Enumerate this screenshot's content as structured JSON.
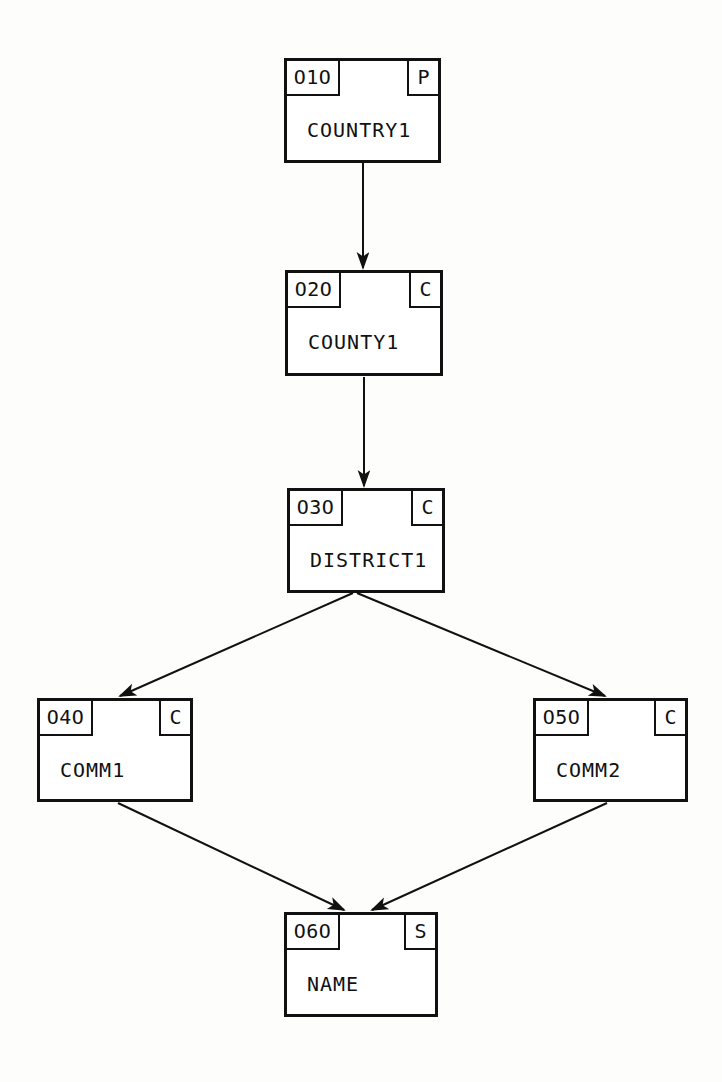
{
  "diagram": {
    "background_color": "#fdfdfb",
    "line_color": "#111111",
    "nodes": [
      {
        "id": "O1O",
        "label": "COUNTRY1",
        "flag": "P"
      },
      {
        "id": "O2O",
        "label": "COUNTY1",
        "flag": "C"
      },
      {
        "id": "O3O",
        "label": "DISTRICT1",
        "flag": "C"
      },
      {
        "id": "O4O",
        "label": "COMM1",
        "flag": "C"
      },
      {
        "id": "O5O",
        "label": "COMM2",
        "flag": "C"
      },
      {
        "id": "O6O",
        "label": "NAME",
        "flag": "S"
      }
    ],
    "edges": [
      {
        "name": "edge-country1-to-county1",
        "from": "O1O",
        "to": "O2O"
      },
      {
        "name": "edge-county1-to-district1",
        "from": "O2O",
        "to": "O3O"
      },
      {
        "name": "edge-district1-to-comm1",
        "from": "O3O",
        "to": "O4O"
      },
      {
        "name": "edge-district1-to-comm2",
        "from": "O3O",
        "to": "O5O"
      },
      {
        "name": "edge-comm1-to-name",
        "from": "O4O",
        "to": "O6O"
      },
      {
        "name": "edge-comm2-to-name",
        "from": "O5O",
        "to": "O6O"
      }
    ]
  }
}
